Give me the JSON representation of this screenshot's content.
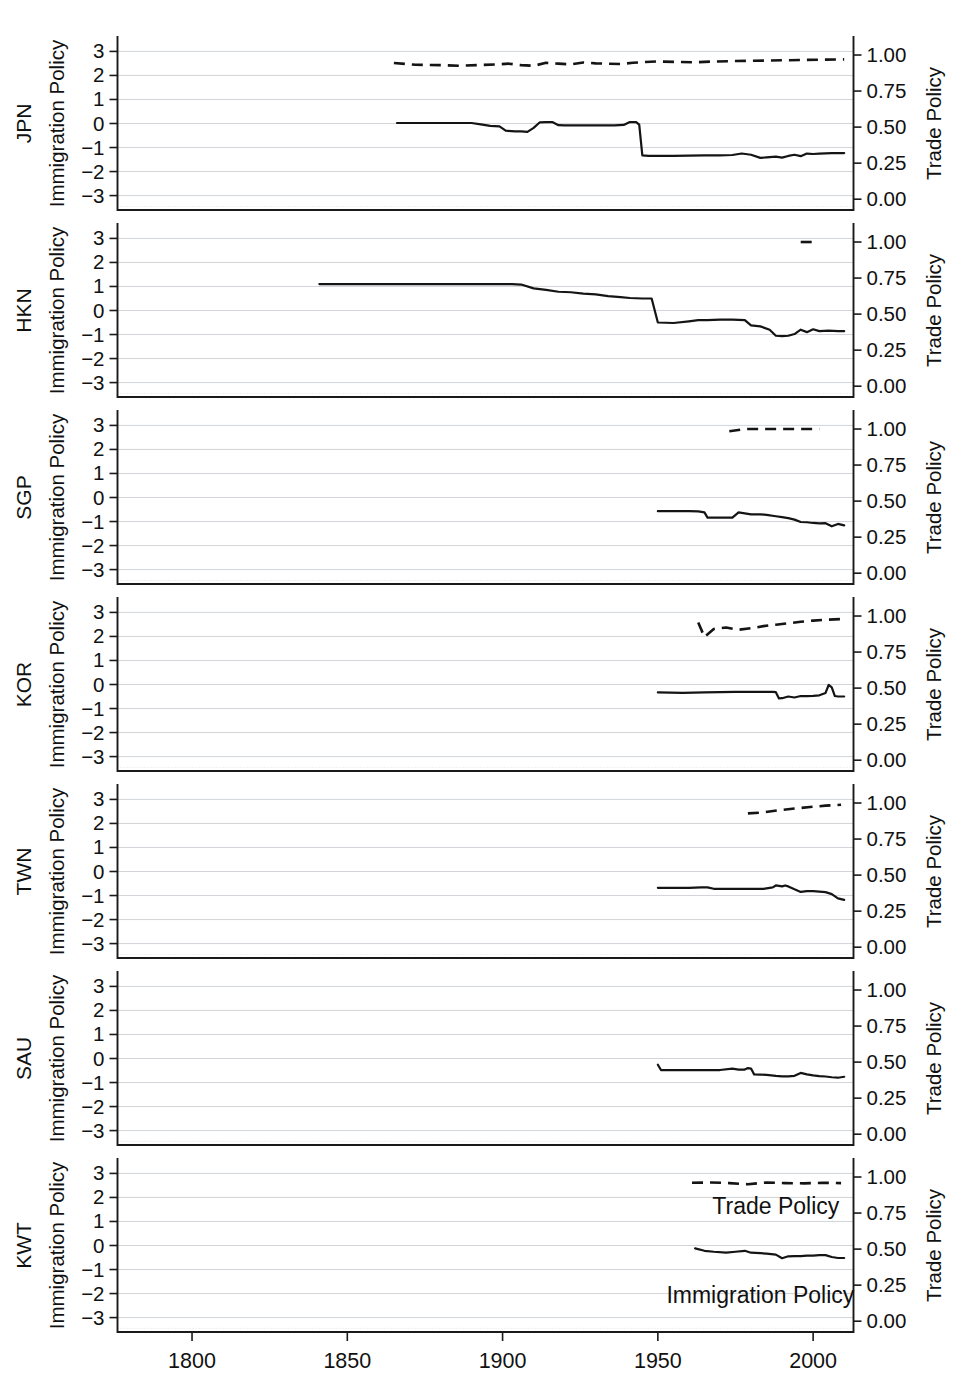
{
  "figure": {
    "width": 957,
    "height": 1373,
    "background": "#ffffff",
    "ink_color": "#141414",
    "grid_color": "#c9ccd1"
  },
  "axes": {
    "left_title": "Immigration Policy",
    "right_title": "Trade Policy",
    "left_ticks": [
      "3",
      "2",
      "1",
      "0",
      "−1",
      "−2",
      "−3"
    ],
    "left_tick_values": [
      3,
      2,
      1,
      0,
      -1,
      -2,
      -3
    ],
    "right_ticks": [
      "1.00",
      "0.75",
      "0.50",
      "0.25",
      "0.00"
    ],
    "right_tick_values": [
      1.0,
      0.75,
      0.5,
      0.25,
      0.0
    ],
    "x_ticks": [
      "1800",
      "1850",
      "1900",
      "1950",
      "2000"
    ],
    "x_tick_values": [
      1800,
      1850,
      1900,
      1950,
      2000
    ],
    "xlim": [
      1776,
      2013
    ],
    "left_ylim": [
      -3.6,
      3.6
    ],
    "right_ylim": [
      -0.075,
      1.125
    ],
    "grid": "horizontal-only"
  },
  "legend": {
    "trade_label": "Trade Policy",
    "immigration_label": "Immigration Policy",
    "position": "inline-bottom-panel"
  },
  "panels": [
    {
      "name": "JPN",
      "label": "JPN"
    },
    {
      "name": "HKN",
      "label": "HKN"
    },
    {
      "name": "SGP",
      "label": "SGP"
    },
    {
      "name": "KOR",
      "label": "KOR"
    },
    {
      "name": "TWN",
      "label": "TWN"
    },
    {
      "name": "SAU",
      "label": "SAU"
    },
    {
      "name": "KWT",
      "label": "KWT"
    }
  ],
  "chart_data": {
    "type": "line",
    "title": "",
    "xlabel": "",
    "ylabel": "Immigration Policy",
    "y2label": "Trade Policy",
    "xlim": [
      1776,
      2013
    ],
    "ylim": [
      -3.6,
      3.6
    ],
    "y2lim": [
      -0.075,
      1.125
    ],
    "grid": true,
    "legend_position": "inline (bottom panel KWT)",
    "panel_layout": "7 stacked panels, shared x-axis",
    "series_styles": {
      "Immigration Policy": "solid, left axis",
      "Trade Policy": "dashed, right axis"
    },
    "panels": [
      {
        "panel": "JPN",
        "series": [
          {
            "name": "Immigration Policy",
            "axis": "left",
            "style": "solid",
            "x": [
              1866,
              1875,
              1885,
              1890,
              1893,
              1896,
              1899,
              1901,
              1904,
              1906,
              1908,
              1910,
              1912,
              1914,
              1916,
              1918,
              1920,
              1924,
              1928,
              1932,
              1936,
              1939,
              1941,
              1943,
              1944,
              1945,
              1947,
              1950,
              1955,
              1960,
              1965,
              1970,
              1974,
              1977,
              1980,
              1983,
              1985,
              1988,
              1990,
              1992,
              1994,
              1996,
              1998,
              2000,
              2002,
              2004,
              2006,
              2008,
              2010
            ],
            "y": [
              0.02,
              0.02,
              0.02,
              0.02,
              -0.04,
              -0.1,
              -0.12,
              -0.3,
              -0.33,
              -0.33,
              -0.35,
              -0.18,
              0.05,
              0.06,
              0.06,
              -0.07,
              -0.08,
              -0.08,
              -0.08,
              -0.08,
              -0.08,
              -0.06,
              0.06,
              0.06,
              -0.05,
              -1.33,
              -1.35,
              -1.35,
              -1.35,
              -1.34,
              -1.33,
              -1.33,
              -1.31,
              -1.25,
              -1.3,
              -1.43,
              -1.41,
              -1.38,
              -1.42,
              -1.35,
              -1.3,
              -1.36,
              -1.25,
              -1.27,
              -1.25,
              -1.24,
              -1.23,
              -1.23,
              -1.23
            ]
          },
          {
            "name": "Trade Policy",
            "axis": "right",
            "style": "dashed",
            "x": [
              1865,
              1872,
              1880,
              1886,
              1892,
              1898,
              1902,
              1906,
              1910,
              1914,
              1918,
              1922,
              1926,
              1930,
              1934,
              1938,
              1942,
              1946,
              1950,
              1956,
              1962,
              1968,
              1974,
              1980,
              1986,
              1992,
              1998,
              2004,
              2010
            ],
            "y": [
              0.945,
              0.932,
              0.93,
              0.925,
              0.93,
              0.935,
              0.94,
              0.93,
              0.925,
              0.946,
              0.94,
              0.935,
              0.948,
              0.942,
              0.94,
              0.938,
              0.946,
              0.952,
              0.955,
              0.952,
              0.95,
              0.955,
              0.958,
              0.96,
              0.962,
              0.964,
              0.966,
              0.968,
              0.97
            ]
          }
        ]
      },
      {
        "panel": "HKN",
        "series": [
          {
            "name": "Immigration Policy",
            "axis": "left",
            "style": "solid",
            "x": [
              1841,
              1860,
              1880,
              1895,
              1900,
              1903,
              1906,
              1910,
              1914,
              1918,
              1922,
              1926,
              1930,
              1934,
              1938,
              1941,
              1945,
              1948,
              1950,
              1955,
              1960,
              1963,
              1966,
              1970,
              1974,
              1978,
              1980,
              1983,
              1986,
              1988,
              1990,
              1992,
              1994,
              1996,
              1998,
              2000,
              2002,
              2005,
              2008,
              2010
            ],
            "y": [
              1.1,
              1.1,
              1.1,
              1.1,
              1.1,
              1.1,
              1.08,
              0.92,
              0.86,
              0.78,
              0.76,
              0.7,
              0.67,
              0.6,
              0.56,
              0.52,
              0.5,
              0.5,
              -0.5,
              -0.52,
              -0.45,
              -0.4,
              -0.4,
              -0.38,
              -0.38,
              -0.4,
              -0.62,
              -0.66,
              -0.8,
              -1.05,
              -1.07,
              -1.05,
              -0.98,
              -0.8,
              -0.9,
              -0.78,
              -0.86,
              -0.84,
              -0.86,
              -0.86
            ]
          },
          {
            "name": "Trade Policy",
            "axis": "right",
            "style": "dashed",
            "x": [
              1996,
              2001
            ],
            "y": [
              1.0,
              1.0
            ]
          }
        ]
      },
      {
        "panel": "SGP",
        "series": [
          {
            "name": "Immigration Policy",
            "axis": "left",
            "style": "solid",
            "x": [
              1950,
              1955,
              1960,
              1963,
              1965,
              1966,
              1968,
              1972,
              1974,
              1976,
              1978,
              1980,
              1983,
              1985,
              1988,
              1990,
              1992,
              1994,
              1996,
              1998,
              2000,
              2002,
              2004,
              2006,
              2008,
              2010
            ],
            "y": [
              -0.57,
              -0.57,
              -0.57,
              -0.58,
              -0.62,
              -0.84,
              -0.84,
              -0.84,
              -0.84,
              -0.62,
              -0.66,
              -0.7,
              -0.7,
              -0.72,
              -0.78,
              -0.82,
              -0.86,
              -0.92,
              -1.02,
              -1.03,
              -1.06,
              -1.08,
              -1.07,
              -1.2,
              -1.1,
              -1.16
            ]
          },
          {
            "name": "Trade Policy",
            "axis": "right",
            "style": "dashed",
            "x": [
              1973,
              1978,
              1984,
              1990,
              1996,
              2002
            ],
            "y": [
              0.985,
              1.0,
              1.0,
              1.0,
              1.0,
              1.0
            ]
          }
        ]
      },
      {
        "panel": "KOR",
        "series": [
          {
            "name": "Immigration Policy",
            "axis": "left",
            "style": "solid",
            "x": [
              1950,
              1958,
              1965,
              1970,
              1975,
              1980,
              1985,
              1987,
              1988,
              1989,
              1990,
              1992,
              1994,
              1996,
              1998,
              2000,
              2002,
              2004,
              2005,
              2006,
              2007,
              2008,
              2010
            ],
            "y": [
              -0.33,
              -0.35,
              -0.33,
              -0.32,
              -0.31,
              -0.31,
              -0.31,
              -0.31,
              -0.32,
              -0.58,
              -0.57,
              -0.5,
              -0.54,
              -0.48,
              -0.48,
              -0.47,
              -0.45,
              -0.35,
              -0.02,
              -0.12,
              -0.48,
              -0.5,
              -0.5
            ]
          },
          {
            "name": "Trade Policy",
            "axis": "right",
            "style": "dashed",
            "x": [
              1963,
              1965,
              1968,
              1972,
              1976,
              1980,
              1984,
              1988,
              1992,
              1996,
              2000,
              2005,
              2010
            ],
            "y": [
              0.955,
              0.855,
              0.91,
              0.92,
              0.905,
              0.915,
              0.93,
              0.94,
              0.95,
              0.96,
              0.968,
              0.975,
              0.98
            ]
          }
        ]
      },
      {
        "panel": "TWN",
        "series": [
          {
            "name": "Immigration Policy",
            "axis": "left",
            "style": "solid",
            "x": [
              1950,
              1956,
              1960,
              1964,
              1966,
              1968,
              1972,
              1976,
              1980,
              1984,
              1987,
              1988,
              1990,
              1991,
              1992,
              1994,
              1996,
              1998,
              2000,
              2002,
              2004,
              2006,
              2008,
              2010
            ],
            "y": [
              -0.68,
              -0.68,
              -0.68,
              -0.66,
              -0.66,
              -0.72,
              -0.72,
              -0.72,
              -0.72,
              -0.72,
              -0.66,
              -0.58,
              -0.62,
              -0.58,
              -0.62,
              -0.74,
              -0.85,
              -0.82,
              -0.82,
              -0.84,
              -0.86,
              -0.94,
              -1.12,
              -1.18
            ]
          },
          {
            "name": "Trade Policy",
            "axis": "right",
            "style": "dashed",
            "x": [
              1979,
              1984,
              1989,
              1994,
              1999,
              2004,
              2009
            ],
            "y": [
              0.928,
              0.935,
              0.95,
              0.962,
              0.972,
              0.982,
              0.988
            ]
          }
        ]
      },
      {
        "panel": "SAU",
        "series": [
          {
            "name": "Immigration Policy",
            "axis": "left",
            "style": "solid",
            "x": [
              1950,
              1951,
              1955,
              1960,
              1965,
              1970,
              1974,
              1976,
              1978,
              1979,
              1980,
              1981,
              1983,
              1985,
              1988,
              1990,
              1992,
              1994,
              1996,
              1998,
              2000,
              2002,
              2004,
              2006,
              2008,
              2010
            ],
            "y": [
              -0.26,
              -0.48,
              -0.48,
              -0.48,
              -0.48,
              -0.48,
              -0.42,
              -0.46,
              -0.46,
              -0.4,
              -0.42,
              -0.66,
              -0.67,
              -0.68,
              -0.72,
              -0.74,
              -0.74,
              -0.72,
              -0.6,
              -0.66,
              -0.7,
              -0.73,
              -0.75,
              -0.78,
              -0.8,
              -0.76
            ]
          }
        ]
      },
      {
        "panel": "KWT",
        "series": [
          {
            "name": "Immigration Policy",
            "axis": "left",
            "style": "solid",
            "x": [
              1962,
              1965,
              1968,
              1972,
              1975,
              1978,
              1980,
              1983,
              1985,
              1988,
              1990,
              1992,
              1994,
              1996,
              1998,
              2000,
              2002,
              2004,
              2006,
              2008,
              2010
            ],
            "y": [
              -0.12,
              -0.22,
              -0.26,
              -0.3,
              -0.26,
              -0.22,
              -0.3,
              -0.32,
              -0.34,
              -0.38,
              -0.53,
              -0.45,
              -0.44,
              -0.44,
              -0.42,
              -0.42,
              -0.4,
              -0.4,
              -0.48,
              -0.52,
              -0.52
            ]
          },
          {
            "name": "Trade Policy",
            "axis": "right",
            "style": "dashed",
            "x": [
              1961,
              1967,
              1973,
              1979,
              1985,
              1991,
              1997,
              2003,
              2009
            ],
            "y": [
              0.96,
              0.962,
              0.958,
              0.95,
              0.962,
              0.958,
              0.956,
              0.96,
              0.958
            ]
          }
        ]
      }
    ]
  }
}
